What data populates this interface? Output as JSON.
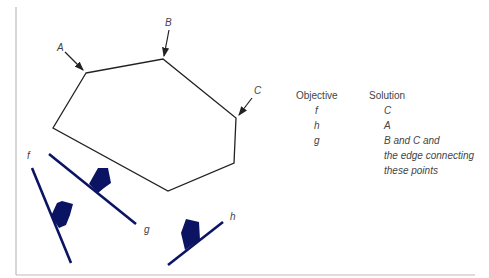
{
  "diagram": {
    "vertex_labels": {
      "A": "A",
      "B": "B",
      "C": "C"
    },
    "objective_labels": {
      "f": "f",
      "g": "g",
      "h": "h"
    },
    "colors": {
      "polygon": "#222222",
      "objective": "#0b1463",
      "frame": "#bbbbbb",
      "text": "#444444"
    }
  },
  "table": {
    "headers": {
      "objective": "Objective",
      "solution": "Solution"
    },
    "rows": [
      {
        "objective": "f",
        "solution": [
          "C"
        ]
      },
      {
        "objective": "h",
        "solution": [
          "A"
        ]
      },
      {
        "objective": "g",
        "solution": [
          "B and C and",
          "the edge connecting",
          "these points"
        ]
      }
    ]
  }
}
